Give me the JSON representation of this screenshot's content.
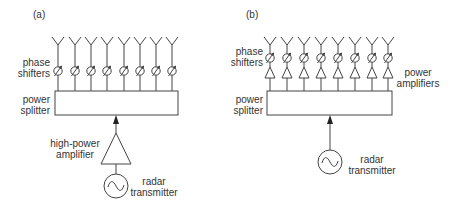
{
  "panel_a": {
    "tag": "(a)",
    "phase_shifters": [
      "phase",
      "shifters"
    ],
    "power_splitter": [
      "power",
      "splitter"
    ],
    "amplifier": [
      "high-power",
      "amplifier"
    ],
    "transmitter": [
      "radar",
      "transmitter"
    ],
    "element_count": 8
  },
  "panel_b": {
    "tag": "(b)",
    "phase_shifters": [
      "phase",
      "shifters"
    ],
    "power_amplifiers": [
      "power",
      "amplifiers"
    ],
    "power_splitter": [
      "power",
      "splitter"
    ],
    "transmitter": [
      "radar",
      "transmitter"
    ],
    "element_count": 8
  },
  "colors": {
    "stroke": "#444444",
    "text": "#333333"
  }
}
